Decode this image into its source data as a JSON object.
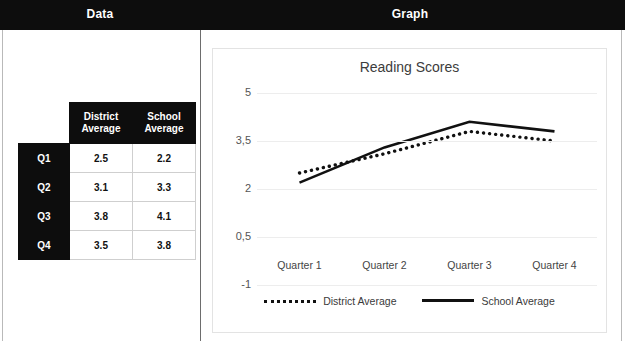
{
  "banner": {
    "left_label": "Data",
    "right_label": "Graph"
  },
  "table": {
    "corner": "",
    "column_headers": [
      "District Average",
      "School Average"
    ],
    "rows": [
      {
        "label": "Q1",
        "district": "2.5",
        "school": "2.2"
      },
      {
        "label": "Q2",
        "district": "3.1",
        "school": "3.3"
      },
      {
        "label": "Q3",
        "district": "3.8",
        "school": "4.1"
      },
      {
        "label": "Q4",
        "district": "3.5",
        "school": "3.8"
      }
    ]
  },
  "chart_data": {
    "type": "line",
    "title": "Reading Scores",
    "xlabel": "",
    "ylabel": "",
    "categories": [
      "Quarter 1",
      "Quarter 2",
      "Quarter 3",
      "Quarter 4"
    ],
    "series": [
      {
        "name": "District Average",
        "values": [
          2.5,
          3.1,
          3.8,
          3.5
        ],
        "style": "dotted",
        "color": "#111111"
      },
      {
        "name": "School Average",
        "values": [
          2.2,
          3.3,
          4.1,
          3.8
        ],
        "style": "solid",
        "color": "#111111"
      }
    ],
    "ylim": [
      -1,
      5
    ],
    "ytick_labels": [
      "5",
      "3,5",
      "2",
      "0,5",
      "-1"
    ],
    "ytick_values": [
      5,
      3.5,
      2,
      0.5,
      -1
    ],
    "grid": true,
    "legend_position": "bottom"
  },
  "colors": {
    "banner": "#0d0d0d",
    "grid": "#ededed",
    "series": "#111111",
    "panel_border": "#e3e3e3"
  }
}
